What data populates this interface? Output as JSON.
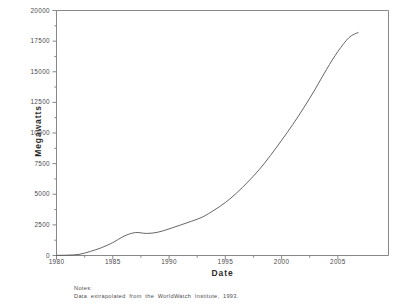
{
  "figure": {
    "background_color": "#ffffff",
    "frame_color": "#7a7a7a",
    "line_color": "#555555"
  },
  "axes": {
    "y_title": "Megawatts",
    "x_title": "Date",
    "y_ticks": [
      0,
      2500,
      5000,
      7500,
      10000,
      12500,
      15000,
      17500,
      20000
    ],
    "y_tick_labels": [
      "0",
      "2500",
      "5000",
      "7500",
      "10000",
      "12500",
      "15000",
      "17500",
      "20000"
    ],
    "x_ticks": [
      1980,
      1985,
      1990,
      1995,
      2000,
      2005
    ],
    "x_tick_labels": [
      "1980",
      "1985",
      "1990",
      "1995",
      "2000",
      "2005"
    ]
  },
  "notes": {
    "heading": "Notes:",
    "body": "Data extrapolated from the WorldWatch Institute, 1993."
  },
  "chart_data": {
    "type": "line",
    "title": "",
    "xlabel": "Date",
    "ylabel": "Megawatts",
    "xlim": [
      1980,
      2009.5
    ],
    "ylim": [
      0,
      20000
    ],
    "grid": false,
    "legend": null,
    "series": [
      {
        "name": "Installed wind capacity",
        "x": [
          1980,
          1981,
          1982,
          1983,
          1984,
          1985,
          1986,
          1987,
          1988,
          1989,
          1990,
          1991,
          1992,
          1993,
          1994,
          1995,
          1996,
          1997,
          1998,
          1999,
          2000,
          2001,
          2002,
          2003,
          2004,
          2005,
          2006,
          2006.8
        ],
        "values": [
          10,
          30,
          90,
          330,
          640,
          1050,
          1580,
          1870,
          1800,
          1900,
          2170,
          2480,
          2800,
          3150,
          3700,
          4320,
          5100,
          6000,
          7000,
          8150,
          9400,
          10700,
          12100,
          13600,
          15200,
          16650,
          17800,
          18200
        ]
      }
    ],
    "annotations": [
      {
        "text": "Notes: Data extrapolated from the WorldWatch Institute, 1993.",
        "position": "below-axis-left"
      }
    ]
  }
}
